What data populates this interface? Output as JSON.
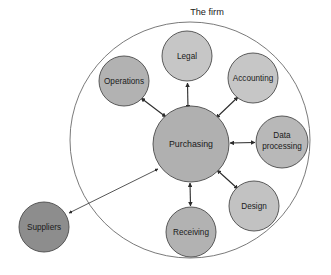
{
  "diagram": {
    "type": "hub-and-spoke-relationship-diagram",
    "title": "The firm",
    "background_color": "#ffffff",
    "boundary": {
      "label": "The firm",
      "shape": "ellipse",
      "cx": 190,
      "cy": 140,
      "rx": 120,
      "ry": 118,
      "stroke_color": "#6b6b6b",
      "label_x": 207,
      "label_y": 13
    },
    "nodes": [
      {
        "id": "purchasing",
        "label": "Purchasing",
        "cx": 191,
        "cy": 144,
        "r": 38,
        "fill": "#b0b0b0",
        "stroke": "#4a4a4a",
        "inside_firm": true,
        "is_hub": true,
        "lines": [
          "Purchasing"
        ]
      },
      {
        "id": "legal",
        "label": "Legal",
        "cx": 187,
        "cy": 56,
        "r": 25,
        "fill": "#c6c6c6",
        "stroke": "#4a4a4a",
        "inside_firm": true,
        "is_hub": false,
        "lines": [
          "Legal"
        ]
      },
      {
        "id": "operations",
        "label": "Operations",
        "cx": 124,
        "cy": 81,
        "r": 25,
        "fill": "#b2b2b2",
        "stroke": "#4a4a4a",
        "inside_firm": true,
        "is_hub": false,
        "lines": [
          "Operations"
        ]
      },
      {
        "id": "accounting",
        "label": "Accounting",
        "cx": 253,
        "cy": 78,
        "r": 25,
        "fill": "#c6c6c6",
        "stroke": "#4a4a4a",
        "inside_firm": true,
        "is_hub": false,
        "lines": [
          "Accounting"
        ]
      },
      {
        "id": "data-processing",
        "label": "Data processing",
        "cx": 282,
        "cy": 142,
        "r": 26,
        "fill": "#b8b8b8",
        "stroke": "#4a4a4a",
        "inside_firm": true,
        "is_hub": false,
        "lines": [
          "Data",
          "processing"
        ]
      },
      {
        "id": "design",
        "label": "Design",
        "cx": 254,
        "cy": 206,
        "r": 25,
        "fill": "#c2c2c2",
        "stroke": "#4a4a4a",
        "inside_firm": true,
        "is_hub": false,
        "lines": [
          "Design"
        ]
      },
      {
        "id": "receiving",
        "label": "Receiving",
        "cx": 191,
        "cy": 232,
        "r": 25,
        "fill": "#b2b2b2",
        "stroke": "#4a4a4a",
        "inside_firm": true,
        "is_hub": false,
        "lines": [
          "Receiving"
        ]
      },
      {
        "id": "suppliers",
        "label": "Suppliers",
        "cx": 44,
        "cy": 227,
        "r": 25,
        "fill": "#8d8d8d",
        "stroke": "#4a4a4a",
        "inside_firm": false,
        "is_hub": false,
        "lines": [
          "Suppliers"
        ]
      }
    ],
    "connections": [
      {
        "id": "purchasing-legal",
        "from": "purchasing",
        "to": "legal",
        "arrow": "double",
        "style": "short"
      },
      {
        "id": "purchasing-operations",
        "from": "purchasing",
        "to": "operations",
        "arrow": "double",
        "style": "short"
      },
      {
        "id": "purchasing-accounting",
        "from": "purchasing",
        "to": "accounting",
        "arrow": "double",
        "style": "short"
      },
      {
        "id": "purchasing-data-processing",
        "from": "purchasing",
        "to": "data-processing",
        "arrow": "double",
        "style": "short"
      },
      {
        "id": "purchasing-design",
        "from": "purchasing",
        "to": "design",
        "arrow": "double",
        "style": "short"
      },
      {
        "id": "purchasing-receiving",
        "from": "purchasing",
        "to": "receiving",
        "arrow": "double",
        "style": "short"
      },
      {
        "id": "purchasing-suppliers",
        "from": "purchasing",
        "to": "suppliers",
        "arrow": "double",
        "style": "long"
      }
    ]
  }
}
